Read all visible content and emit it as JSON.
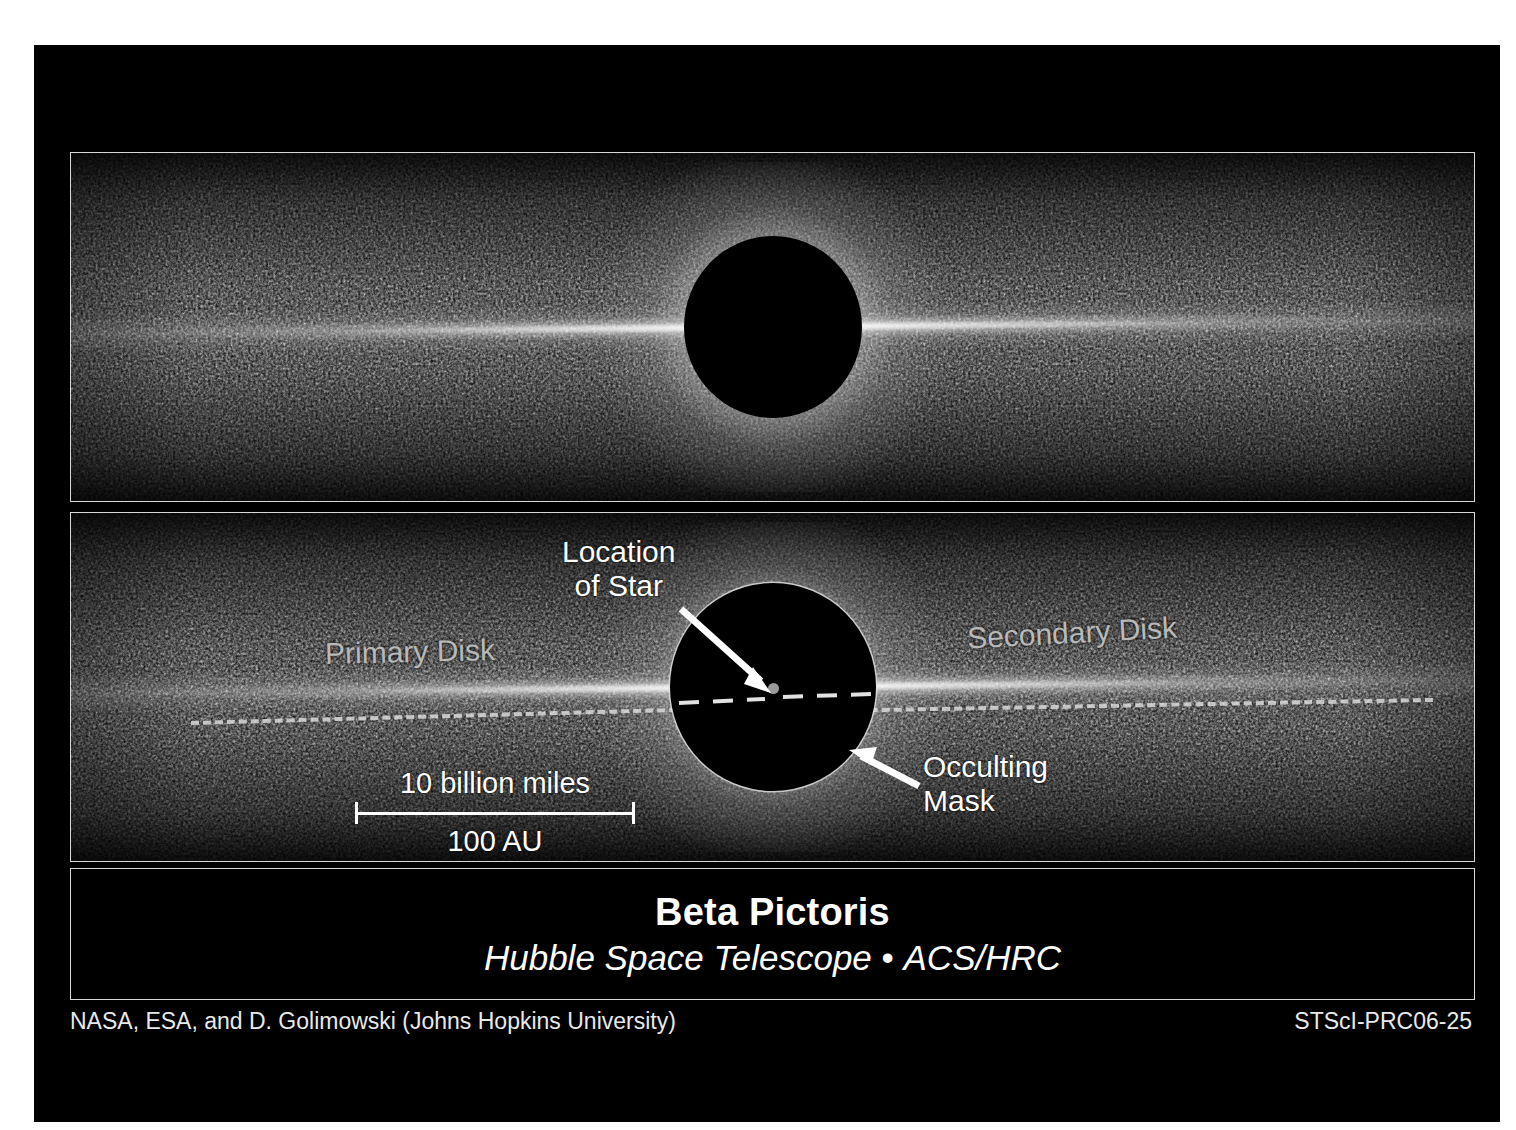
{
  "image": {
    "panels": [
      {
        "name": "top-panel",
        "description": "Beta Pictoris debris disk, coronagraphic image, unannotated"
      },
      {
        "name": "bottom-panel",
        "description": "Same image with annotations identifying disks, star and mask"
      }
    ]
  },
  "annotations": {
    "location_of_star": "Location\nof Star",
    "occulting_mask": "Occulting\nMask",
    "primary_disk": "Primary Disk",
    "secondary_disk": "Secondary Disk"
  },
  "scalebar": {
    "top_label": "10 billion miles",
    "bottom_label": "100 AU"
  },
  "title": {
    "object": "Beta Pictoris",
    "instrument_prefix": "Hubble Space Telescope",
    "separator": " • ",
    "instrument": "ACS/HRC"
  },
  "credits": {
    "left": "NASA, ESA, and D. Golimowski (Johns Hopkins University)",
    "right": "STScI-PRC06-25"
  },
  "colors": {
    "background": "#ffffff",
    "canvas": "#000000",
    "border": "#d8d8d8",
    "text": "#ffffff",
    "disk_label": "#b9b9b9",
    "star_dot": "#9a9a9a"
  }
}
